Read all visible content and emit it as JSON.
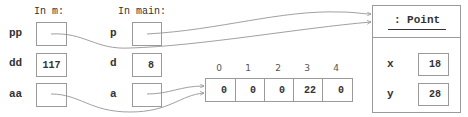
{
  "frames": {
    "m": {
      "header": "In m:",
      "vars": [
        {
          "name": "pp",
          "value": "",
          "kind": "reference",
          "target": "point"
        },
        {
          "name": "dd",
          "value": "117",
          "kind": "primitive"
        },
        {
          "name": "aa",
          "value": "",
          "kind": "reference",
          "target": "array"
        }
      ]
    },
    "main": {
      "header": "In main:",
      "vars": [
        {
          "name": "p",
          "value": "",
          "kind": "reference",
          "target": "point"
        },
        {
          "name": "d",
          "value": "8",
          "kind": "primitive"
        },
        {
          "name": "a",
          "value": "",
          "kind": "reference",
          "target": "array"
        }
      ]
    }
  },
  "array": {
    "indices": [
      "0",
      "1",
      "2",
      "3",
      "4"
    ],
    "values": [
      "0",
      "0",
      "0",
      "22",
      "0"
    ]
  },
  "point": {
    "title": ": Point",
    "fields": [
      {
        "name": "x",
        "value": "18"
      },
      {
        "name": "y",
        "value": "28"
      }
    ]
  },
  "colors": {
    "border": "#9a9a9a",
    "arrow": "#888888",
    "text": "#333333"
  }
}
